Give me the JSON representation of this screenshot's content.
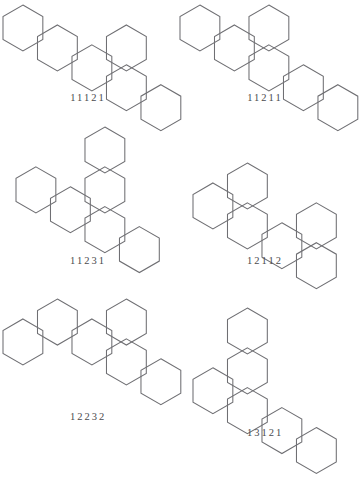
{
  "page": {
    "kind": "polyhex-figure-sheet",
    "background_color": "#ffffff",
    "stroke_color": "#6f6f73",
    "label_color": "#4a4a4e",
    "columns": 2,
    "rows": 3
  },
  "hex_geometry": {
    "orientation": "pointy-top",
    "circumradius_px": 23,
    "note": "axial coordinates; col step = 1.5R horizontally, row step = sqrt(3)/2*R"
  },
  "figures": [
    {
      "id": "fig-11121",
      "label": "11121",
      "cells": [
        [
          0,
          0
        ],
        [
          1,
          0
        ],
        [
          2,
          0
        ],
        [
          3,
          0
        ],
        [
          3,
          -1
        ],
        [
          4,
          0
        ]
      ],
      "width": 176,
      "height": 115
    },
    {
      "id": "fig-11211",
      "label": "11211",
      "cells": [
        [
          0,
          0
        ],
        [
          1,
          0
        ],
        [
          2,
          0
        ],
        [
          2,
          -1
        ],
        [
          3,
          0
        ],
        [
          4,
          0
        ]
      ],
      "width": 176,
      "height": 115
    },
    {
      "id": "fig-11231",
      "label": "11231",
      "cells": [
        [
          0,
          0
        ],
        [
          1,
          0
        ],
        [
          2,
          0
        ],
        [
          2,
          -1
        ],
        [
          2,
          -2
        ],
        [
          3,
          0
        ]
      ],
      "width": 176,
      "height": 150
    },
    {
      "id": "fig-12112",
      "label": "12112",
      "cells": [
        [
          0,
          0
        ],
        [
          1,
          0
        ],
        [
          1,
          -1
        ],
        [
          2,
          0
        ],
        [
          3,
          0
        ],
        [
          3,
          -1
        ]
      ],
      "width": 176,
      "height": 130
    },
    {
      "id": "fig-12232",
      "label": "12232",
      "cells": [
        [
          0,
          0
        ],
        [
          1,
          -1
        ],
        [
          2,
          -1
        ],
        [
          3,
          -1
        ],
        [
          3,
          -2
        ],
        [
          4,
          -1
        ]
      ],
      "width": 176,
      "height": 150
    },
    {
      "id": "fig-13121",
      "label": "13121",
      "cells": [
        [
          0,
          0
        ],
        [
          1,
          0
        ],
        [
          1,
          -1
        ],
        [
          1,
          -2
        ],
        [
          2,
          0
        ],
        [
          3,
          0
        ]
      ],
      "width": 176,
      "height": 155
    }
  ]
}
